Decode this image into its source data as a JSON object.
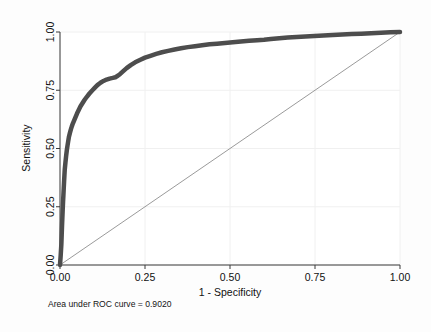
{
  "figure": {
    "background_color": "#fdfdfd",
    "plot_background_color": "#ffffff",
    "caption": "Area under ROC curve = 0.9020"
  },
  "axes": {
    "x_title": "1 - Specificity",
    "y_title": "Sensitivity",
    "x_ticks": [
      "0.00",
      "0.25",
      "0.50",
      "0.75",
      "1.00"
    ],
    "y_ticks": [
      "0.00",
      "0.25",
      "0.50",
      "0.75",
      "1.00"
    ],
    "axis_color": "#3a3a3a",
    "grid_color": "#f0f0f0"
  },
  "chart_data": {
    "type": "line",
    "title": "",
    "subtitle": "",
    "xlabel": "1 - Specificity",
    "ylabel": "Sensitivity",
    "xlim": [
      0,
      1
    ],
    "ylim": [
      0,
      1
    ],
    "xticks": [
      0,
      0.25,
      0.5,
      0.75,
      1
    ],
    "yticks": [
      0,
      0.25,
      0.5,
      0.75,
      1
    ],
    "grid": true,
    "legend": null,
    "annotations": [
      "Area under ROC curve = 0.9020"
    ],
    "auc": 0.902,
    "series": [
      {
        "name": "ROC curve",
        "color": "#4d4d4d",
        "line_width": 4.5,
        "x": [
          0.0,
          0.002,
          0.004,
          0.005,
          0.006,
          0.007,
          0.008,
          0.009,
          0.01,
          0.011,
          0.012,
          0.013,
          0.014,
          0.016,
          0.018,
          0.02,
          0.022,
          0.024,
          0.026,
          0.029,
          0.032,
          0.035,
          0.038,
          0.042,
          0.046,
          0.05,
          0.055,
          0.06,
          0.066,
          0.072,
          0.079,
          0.086,
          0.094,
          0.102,
          0.11,
          0.119,
          0.128,
          0.137,
          0.146,
          0.155,
          0.163,
          0.17,
          0.177,
          0.186,
          0.196,
          0.208,
          0.221,
          0.235,
          0.25,
          0.266,
          0.283,
          0.3,
          0.318,
          0.337,
          0.356,
          0.376,
          0.397,
          0.418,
          0.44,
          0.462,
          0.485,
          0.508,
          0.532,
          0.556,
          0.58,
          0.6,
          0.62,
          0.645,
          0.67,
          0.696,
          0.722,
          0.748,
          0.775,
          0.802,
          0.83,
          0.858,
          0.886,
          0.915,
          0.944,
          0.972,
          1.0
        ],
        "y": [
          0.0,
          0.04,
          0.09,
          0.13,
          0.17,
          0.205,
          0.24,
          0.272,
          0.3,
          0.33,
          0.358,
          0.385,
          0.41,
          0.44,
          0.468,
          0.492,
          0.512,
          0.53,
          0.548,
          0.566,
          0.582,
          0.596,
          0.608,
          0.622,
          0.636,
          0.65,
          0.665,
          0.68,
          0.694,
          0.708,
          0.722,
          0.735,
          0.748,
          0.76,
          0.772,
          0.782,
          0.79,
          0.796,
          0.8,
          0.803,
          0.806,
          0.812,
          0.82,
          0.832,
          0.845,
          0.858,
          0.87,
          0.88,
          0.89,
          0.898,
          0.906,
          0.913,
          0.919,
          0.925,
          0.93,
          0.935,
          0.939,
          0.943,
          0.947,
          0.95,
          0.953,
          0.956,
          0.959,
          0.962,
          0.965,
          0.967,
          0.97,
          0.973,
          0.976,
          0.979,
          0.981,
          0.983,
          0.985,
          0.987,
          0.989,
          0.991,
          0.993,
          0.995,
          0.997,
          0.999,
          1.0
        ]
      },
      {
        "name": "Reference line",
        "color": "#808080",
        "line_width": 0.8,
        "x": [
          0,
          1
        ],
        "y": [
          0,
          1
        ]
      }
    ]
  }
}
